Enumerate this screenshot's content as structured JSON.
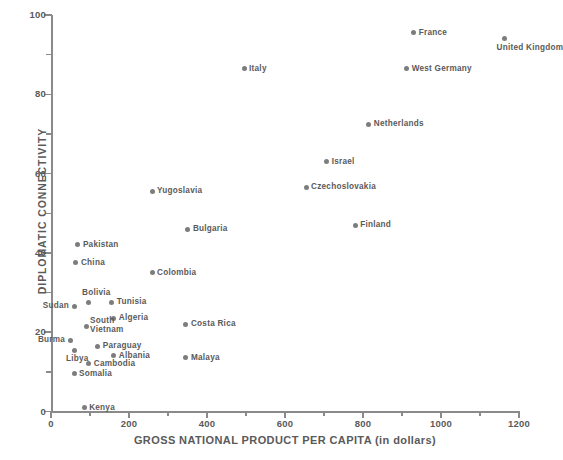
{
  "chart_data": {
    "type": "scatter",
    "title": "",
    "xlabel": "GROSS NATIONAL PRODUCT PER CAPITA (in dollars)",
    "ylabel": "DIPLOMATIC CONNECTIVITY",
    "xlim": [
      0,
      1200
    ],
    "ylim": [
      0,
      100
    ],
    "xticks": [
      0,
      200,
      400,
      600,
      800,
      1000,
      1200
    ],
    "xticks_minor": [
      100,
      300,
      500,
      700,
      900,
      1100
    ],
    "yticks": [
      0,
      20,
      40,
      60,
      80,
      100
    ],
    "yticks_minor": [
      10,
      30,
      50,
      70,
      90
    ],
    "grid": false,
    "legend": "none",
    "marker_color": "#7d7d7d",
    "axis_color": "#8a8a8a",
    "text_color": "#5a5a5a",
    "points": [
      {
        "label": "France",
        "x": 930,
        "y": 95.5,
        "pos": "right"
      },
      {
        "label": "United Kingdom",
        "x": 1163,
        "y": 94,
        "pos": "below"
      },
      {
        "label": "Italy",
        "x": 495,
        "y": 86.5,
        "pos": "right"
      },
      {
        "label": "West Germany",
        "x": 912,
        "y": 86.5,
        "pos": "right"
      },
      {
        "label": "Netherlands",
        "x": 815,
        "y": 72.5,
        "pos": "right"
      },
      {
        "label": "Israel",
        "x": 707,
        "y": 63,
        "pos": "right"
      },
      {
        "label": "Czechoslovakia",
        "x": 654,
        "y": 56.5,
        "pos": "right"
      },
      {
        "label": "Yugoslavia",
        "x": 259,
        "y": 55.5,
        "pos": "right"
      },
      {
        "label": "Finland",
        "x": 780,
        "y": 47,
        "pos": "right"
      },
      {
        "label": "Bulgaria",
        "x": 351,
        "y": 46,
        "pos": "right"
      },
      {
        "label": "Pakistan",
        "x": 69,
        "y": 42,
        "pos": "right"
      },
      {
        "label": "China",
        "x": 64,
        "y": 37.5,
        "pos": "right"
      },
      {
        "label": "Colombia",
        "x": 259,
        "y": 35,
        "pos": "right"
      },
      {
        "label": "Bolivia",
        "x": 95,
        "y": 27.5,
        "pos": "above"
      },
      {
        "label": "Tunisia",
        "x": 156,
        "y": 27.5,
        "pos": "right"
      },
      {
        "label": "Sudan",
        "x": 59,
        "y": 26.5,
        "pos": "left"
      },
      {
        "label": "Algeria",
        "x": 161,
        "y": 23.5,
        "pos": "right"
      },
      {
        "label": "South Vietnam",
        "x": 90,
        "y": 21.5,
        "pos": "stack"
      },
      {
        "label": "Costa Rica",
        "x": 346,
        "y": 22,
        "pos": "right"
      },
      {
        "label": "Burma",
        "x": 49,
        "y": 18,
        "pos": "left"
      },
      {
        "label": "Paraguay",
        "x": 120,
        "y": 16.5,
        "pos": "right"
      },
      {
        "label": "Libya",
        "x": 59,
        "y": 15.5,
        "pos": "below"
      },
      {
        "label": "Albania",
        "x": 161,
        "y": 14,
        "pos": "right"
      },
      {
        "label": "Malaya",
        "x": 346,
        "y": 13.5,
        "pos": "right"
      },
      {
        "label": "Cambodia",
        "x": 97,
        "y": 12,
        "pos": "right"
      },
      {
        "label": "Somalia",
        "x": 59,
        "y": 9.5,
        "pos": "right"
      },
      {
        "label": "Kenya",
        "x": 85,
        "y": 1,
        "pos": "right"
      }
    ]
  }
}
